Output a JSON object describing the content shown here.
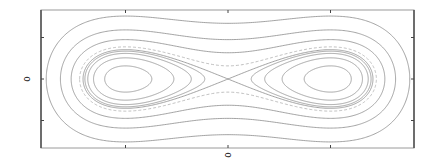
{
  "chart_data": {
    "type": "line",
    "subtype": "contour / phase portrait",
    "title": "",
    "xlabel": "",
    "ylabel": "",
    "xlim": [
      -1.9,
      1.9
    ],
    "ylim": [
      -1.65,
      1.65
    ],
    "grid": false,
    "legend": null,
    "x_tick_labels": [
      {
        "value": 0,
        "label": "0"
      }
    ],
    "y_tick_labels": [
      {
        "value": 0,
        "label": "0"
      }
    ],
    "x_ticks": [
      -1,
      0,
      1
    ],
    "y_ticks": [
      -1,
      0,
      1
    ],
    "levels": [
      -0.2,
      -0.12,
      -0.06,
      -0.025,
      0,
      0.05,
      0.2,
      0.45,
      0.9
    ],
    "separatrix_level": 0,
    "dashed_levels": [
      0.05
    ],
    "centers": [
      {
        "x": -1,
        "y": 0
      },
      {
        "x": 1,
        "y": 0
      }
    ],
    "saddle": {
      "x": 0,
      "y": 0
    }
  },
  "axes": {
    "x_label_text": "0",
    "y_label_text": "0"
  },
  "layout": {
    "frame": {
      "x0": 41,
      "y0": 10,
      "x1": 414,
      "y1": 148
    },
    "origin_px": {
      "x": 228,
      "y": 79
    },
    "x_unit_px": 102.5,
    "y_unit_px": 41.5
  }
}
